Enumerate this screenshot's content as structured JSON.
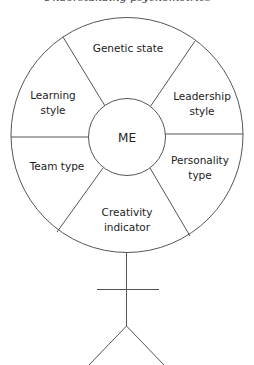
{
  "title": "Understanding psychometrics",
  "diagram": {
    "center": {
      "label": "ME"
    },
    "segments": [
      {
        "id": "genetic-state",
        "lines": [
          "Genetic state"
        ]
      },
      {
        "id": "leadership-style",
        "lines": [
          "Leadership",
          "style"
        ]
      },
      {
        "id": "personality-type",
        "lines": [
          "Personality",
          "type"
        ]
      },
      {
        "id": "creativity-indicator",
        "lines": [
          "Creativity",
          "indicator"
        ]
      },
      {
        "id": "team-type",
        "lines": [
          "Team type"
        ]
      },
      {
        "id": "learning-style",
        "lines": [
          "Learning",
          "style"
        ]
      }
    ],
    "figure": "stick-figure-body",
    "colors": {
      "line": "#555555",
      "text": "#222222",
      "background": "#ffffff"
    }
  }
}
